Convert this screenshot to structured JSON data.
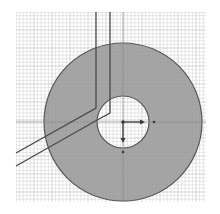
{
  "view": {
    "type": "cad-sketch-viewport",
    "background": "#ffffff",
    "grid": {
      "x0": 16,
      "y0": 12,
      "x1": 206,
      "y1": 202,
      "minor_spacing": 3.6,
      "major_every": 5,
      "minor_color": "#d6d6d6",
      "major_color": "#bdbdbd"
    },
    "annulus": {
      "cx": 123,
      "cy": 122,
      "outer_r": 79,
      "inner_r": 26,
      "fill": "#a6a6a6",
      "stroke": "#555555"
    },
    "slot_edges": [
      {
        "points": "96,12 96,108 16,153"
      },
      {
        "points": "110,12 110,113 99,119 16,166"
      }
    ],
    "slot_color": "#4a4a4a",
    "origin": {
      "x": 123,
      "y": 122,
      "x_axis_end": {
        "x": 145,
        "y": 122
      },
      "y_axis_end": {
        "x": 123,
        "y": 143
      },
      "x_dot": {
        "x": 154,
        "y": 122
      },
      "y_dot": {
        "x": 123,
        "y": 152
      },
      "color": "#3a3a3a"
    },
    "center_lines": {
      "vertical_x": 123,
      "horizontal_y": 122,
      "color": "#8a8a8a"
    }
  }
}
